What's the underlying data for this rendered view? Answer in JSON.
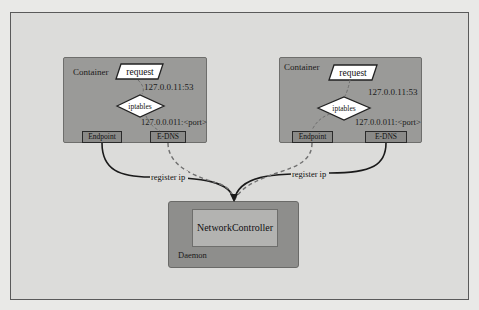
{
  "diagram": {
    "containers": [
      {
        "label": "Container",
        "request_label": "request",
        "iptables_label": "iptables",
        "dns_address": "127.0.0.11:53",
        "port_address": "127.0.0.011:<port>",
        "endpoint_label": "Endpoint",
        "edns_label": "E-DNS"
      },
      {
        "label": "Container",
        "request_label": "request",
        "iptables_label": "iptables",
        "dns_address": "127.0.0.11:53",
        "port_address": "127.0.0.011:<port>",
        "endpoint_label": "Endpoint",
        "edns_label": "E-DNS"
      }
    ],
    "edges": [
      {
        "label": "register ip",
        "style": "solid"
      },
      {
        "label": "register ip",
        "style": "solid"
      }
    ],
    "daemon": {
      "label": "Daemon",
      "controller_label": "NetworkController"
    },
    "colors": {
      "background": "#dcdcda",
      "container_fill": "#9a9a98",
      "daemon_fill": "#8e8e8c",
      "controller_fill": "#b3b3b1",
      "solid_edge": "#1a1a1a",
      "dashed_edge": "#707070"
    }
  }
}
